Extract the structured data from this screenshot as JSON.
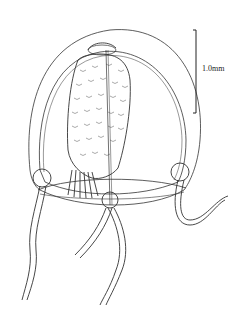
{
  "figure": {
    "scale_bar": {
      "label": "1.0mm"
    }
  }
}
